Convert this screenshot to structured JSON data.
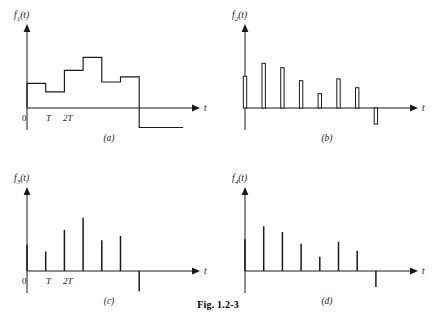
{
  "figure": {
    "caption": "Fig. 1.2-3",
    "t_axis_label": "t"
  },
  "panels": [
    {
      "id": "a",
      "caption": "(a)",
      "y_label_base": "f",
      "y_label_sub": "1",
      "y_label_arg": "(t)",
      "type": "staircase",
      "tick_labels": [
        "0",
        "T",
        "2T"
      ],
      "description": "sample-and-hold staircase waveform"
    },
    {
      "id": "b",
      "caption": "(b)",
      "y_label_base": "f",
      "y_label_sub": "2",
      "y_label_arg": "(t)",
      "type": "pulse-train",
      "tick_labels": [],
      "description": "narrow rectangular pulse train, last pulse negative"
    },
    {
      "id": "c",
      "caption": "(c)",
      "y_label_base": "f",
      "y_label_sub": "3",
      "y_label_arg": "(t)",
      "type": "impulse-train",
      "tick_labels": [
        "0",
        "T",
        "2T"
      ],
      "description": "impulse train, last impulse negative"
    },
    {
      "id": "d",
      "caption": "(d)",
      "y_label_base": "f",
      "y_label_sub": "4",
      "y_label_arg": "(t)",
      "type": "impulse-train",
      "tick_labels": [],
      "description": "impulse train matching pulse-train envelope, last impulse negative"
    }
  ],
  "chart_data": [
    {
      "type": "line",
      "panel": "a",
      "title": "f1(t)",
      "xlabel": "t",
      "ylabel": "f1(t)",
      "subcaption": "(a)",
      "grid": false,
      "legend": "none",
      "x_tick_labels": [
        "0",
        "T",
        "2T"
      ],
      "x_tick_values": [
        0,
        1,
        2
      ],
      "sample_period_T": 1,
      "xlim": [
        -0.35,
        9.0
      ],
      "ylim": [
        -1.1,
        2.3
      ],
      "step_start_times": [
        0,
        1,
        2,
        3,
        4,
        5,
        6
      ],
      "step_values": [
        0.95,
        0.62,
        1.45,
        1.95,
        1.0,
        1.2,
        -0.75
      ],
      "step_width": 1
    },
    {
      "type": "bar",
      "panel": "b",
      "title": "f2(t)",
      "xlabel": "t",
      "ylabel": "f2(t)",
      "subcaption": "(b)",
      "grid": false,
      "legend": "none",
      "x_tick_labels": [],
      "sample_period_T": 1,
      "xlim": [
        -0.35,
        9.0
      ],
      "ylim": [
        -1.1,
        2.3
      ],
      "categories": [
        0,
        1,
        2,
        3,
        4,
        5,
        6,
        7
      ],
      "values": [
        1.22,
        1.72,
        1.55,
        1.05,
        0.55,
        1.12,
        0.78,
        -0.62
      ],
      "bar_width": 0.18
    },
    {
      "type": "bar",
      "panel": "c",
      "title": "f3(t)",
      "xlabel": "t",
      "ylabel": "f3(t)",
      "subcaption": "(c)",
      "grid": false,
      "legend": "none",
      "x_tick_labels": [
        "0",
        "T",
        "2T"
      ],
      "x_tick_values": [
        0,
        1,
        2
      ],
      "sample_period_T": 1,
      "xlim": [
        -0.35,
        9.0
      ],
      "ylim": [
        -1.1,
        2.3
      ],
      "categories": [
        0,
        1,
        2,
        3,
        4,
        5,
        6
      ],
      "values": [
        1.02,
        0.75,
        1.58,
        2.05,
        1.18,
        1.35,
        -0.78
      ],
      "bar_width": 0.035
    },
    {
      "type": "bar",
      "panel": "d",
      "title": "f4(t)",
      "xlabel": "t",
      "ylabel": "f4(t)",
      "subcaption": "(d)",
      "grid": false,
      "legend": "none",
      "x_tick_labels": [],
      "sample_period_T": 1,
      "xlim": [
        -0.35,
        9.0
      ],
      "ylim": [
        -1.1,
        2.3
      ],
      "categories": [
        0,
        1,
        2,
        3,
        4,
        5,
        6,
        7
      ],
      "values": [
        1.22,
        1.72,
        1.5,
        1.05,
        0.55,
        1.12,
        0.78,
        -0.62
      ],
      "bar_width": 0.035
    }
  ]
}
